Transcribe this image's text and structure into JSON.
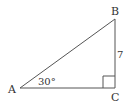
{
  "diagram": {
    "type": "right-triangle",
    "vertices": {
      "A": {
        "label": "A"
      },
      "B": {
        "label": "B"
      },
      "C": {
        "label": "C"
      }
    },
    "angle_A": "30°",
    "side_BC": "7",
    "right_angle_at": "C",
    "colors": {
      "stroke": "#555555",
      "text": "#333333",
      "background": "#ffffff"
    }
  }
}
